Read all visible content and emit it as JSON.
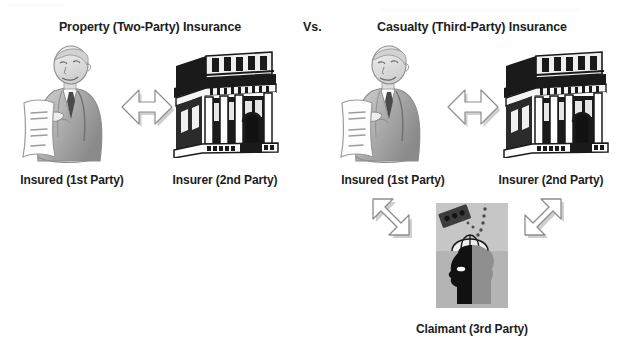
{
  "diagram": {
    "width": 622,
    "height": 343,
    "background_color": "#ffffff",
    "text_color": "#1d1d1d",
    "comparison_label": "Vs."
  },
  "left_panel": {
    "title": "Property (Two-Party) Insurance",
    "insured_label": "Insured (1st Party)",
    "insurer_label": "Insurer (2nd Party)",
    "insured_icon": "businessman-with-document-icon",
    "insurer_icon": "bank-building-icon",
    "relation_arrow": "double-headed-horizontal-arrow-icon"
  },
  "right_panel": {
    "title": "Casualty (Third-Party) Insurance",
    "insured_label": "Insured (1st Party)",
    "insurer_label": "Insurer (2nd Party)",
    "claimant_label": "Claimant (3rd Party)",
    "insured_icon": "businessman-with-document-icon",
    "insurer_icon": "bank-building-icon",
    "claimant_icon": "head-with-umbrella-falling-brick-icon",
    "relation_arrow": "double-headed-horizontal-arrow-icon",
    "claimant_arrow_left": "double-headed-diagonal-arrow-nw-se-icon",
    "claimant_arrow_right": "double-headed-diagonal-arrow-ne-sw-icon"
  },
  "palette": {
    "ink_black": "#111111",
    "sketch_gray": "#9a9a9a",
    "light_gray": "#d8d8d8",
    "panel_gray": "#a8a8a8",
    "arrow_outline": "#8d8d8d",
    "arrow_fill": "#ffffff",
    "shadow": "#c9c9c9"
  }
}
